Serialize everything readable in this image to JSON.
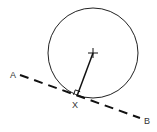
{
  "diagram": {
    "labels": {
      "a": "A",
      "b": "B",
      "x": "X"
    },
    "circle": {
      "cx": 93,
      "cy": 53,
      "r": 45
    },
    "tangent_line": {
      "x1": 20,
      "y1": 75,
      "x2": 140,
      "y2": 118,
      "style": "dashed"
    },
    "radius": {
      "from": "center",
      "to": "X"
    },
    "center_mark": "plus",
    "right_angle_marker": true,
    "colors": {
      "stroke": "#111111",
      "label": "#333333",
      "background": "#ffffff"
    }
  }
}
